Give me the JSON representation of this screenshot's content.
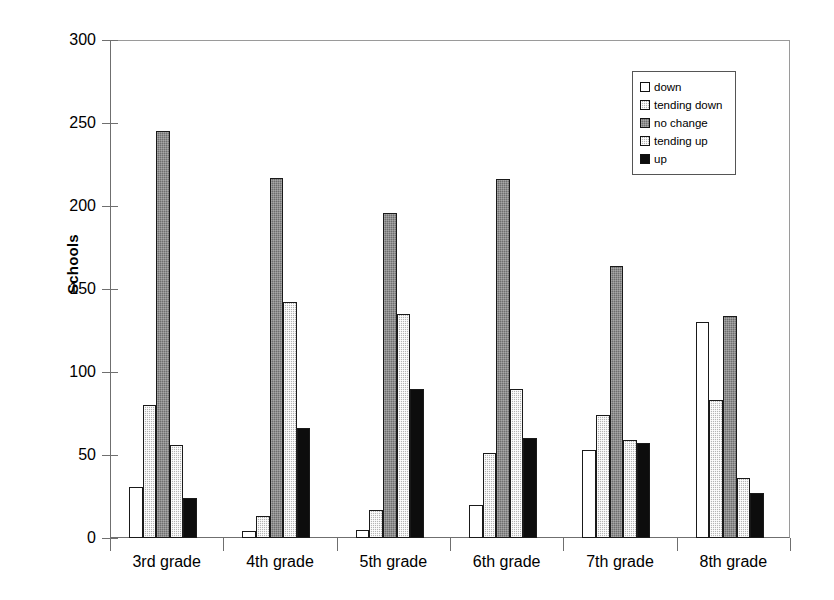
{
  "chart_data": {
    "type": "bar",
    "title": "",
    "xlabel": "",
    "ylabel": "Schools",
    "ylim": [
      0,
      300
    ],
    "yticks": [
      0,
      50,
      100,
      150,
      200,
      250,
      300
    ],
    "ytick_labels": [
      "0",
      "50",
      "100",
      "150",
      "200",
      "250",
      "300"
    ],
    "grid": false,
    "legend_position": "upper right",
    "categories": [
      "3rd grade",
      "4th grade",
      "5th grade",
      "6th grade",
      "7th grade",
      "8th grade"
    ],
    "series": [
      {
        "name": "down",
        "values": [
          31,
          4,
          5,
          20,
          53,
          130
        ]
      },
      {
        "name": "tending down",
        "values": [
          80,
          13,
          17,
          51,
          74,
          83
        ]
      },
      {
        "name": "no change",
        "values": [
          245,
          217,
          196,
          216,
          164,
          134
        ]
      },
      {
        "name": "tending up",
        "values": [
          56,
          142,
          135,
          90,
          59,
          36
        ]
      },
      {
        "name": "up",
        "values": [
          24,
          66,
          90,
          60,
          57,
          27
        ]
      }
    ]
  },
  "legend": {
    "items": [
      {
        "label": "down",
        "swatch": "white",
        "color": "#ffffff"
      },
      {
        "label": "tending down",
        "swatch": "light-dither",
        "color": "#b4b4b4"
      },
      {
        "label": "no change",
        "swatch": "dark-dither",
        "color": "#6e6e6e"
      },
      {
        "label": "tending up",
        "swatch": "light-dither",
        "color": "#b4b4b4"
      },
      {
        "label": "up",
        "swatch": "solid-black",
        "color": "#0d0d0d"
      }
    ]
  },
  "axes": {
    "y_title": "Schools",
    "frame_color": "#6f6f6f"
  }
}
